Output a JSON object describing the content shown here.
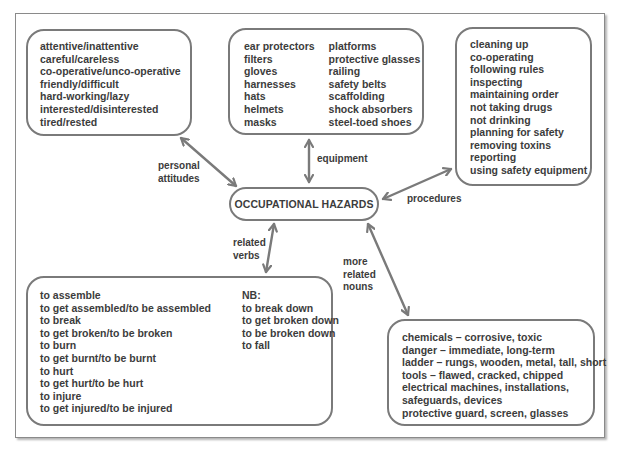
{
  "diagram": {
    "center": {
      "title": "OCCUPATIONAL HAZARDS"
    },
    "links": {
      "personal_attitudes": "personal\nattitudes",
      "personal_attitudes_l1": "personal",
      "personal_attitudes_l2": "attitudes",
      "equipment": "equipment",
      "procedures": "procedures",
      "related_verbs_l1": "related",
      "related_verbs_l2": "verbs",
      "more_related_nouns_l1": "more",
      "more_related_nouns_l2": "related",
      "more_related_nouns_l3": "nouns"
    },
    "personal_attitudes": {
      "items": [
        "attentive/inattentive",
        "careful/careless",
        "co-operative/unco-operative",
        "friendly/difficult",
        "hard-working/lazy",
        "interested/disinterested",
        "tired/rested"
      ]
    },
    "equipment": {
      "col1": [
        "ear protectors",
        "filters",
        "gloves",
        "harnesses",
        "hats",
        "helmets",
        "masks"
      ],
      "col2": [
        "platforms",
        "protective glasses",
        "railing",
        "safety belts",
        "scaffolding",
        "shock absorbers",
        "steel-toed shoes"
      ]
    },
    "procedures": {
      "items": [
        "cleaning up",
        "co-operating",
        "following rules",
        "inspecting",
        "maintaining order",
        "not taking drugs",
        "not drinking",
        "planning for safety",
        "removing toxins",
        "reporting",
        "using safety equipment"
      ]
    },
    "related_verbs": {
      "col1": [
        "to assemble",
        "to get assembled/to be assembled",
        "to break",
        "to get broken/to be broken",
        "to burn",
        "to get burnt/to be burnt",
        "to hurt",
        "to get hurt/to be hurt",
        "to injure",
        "to get injured/to be injured"
      ],
      "col2": [
        "NB:",
        "to break down",
        "to get broken down",
        "to be broken down",
        "to fall"
      ]
    },
    "more_related_nouns": {
      "items": [
        "chemicals – corrosive, toxic",
        "danger – immediate, long-term",
        "ladder – rungs, wooden, metal, tall, short",
        "tools – flawed, cracked, chipped",
        "electrical machines, installations,",
        "safeguards, devices",
        "protective guard, screen, glasses"
      ]
    },
    "colors": {
      "stroke": "#7a7a7a",
      "text": "#3c3c3c",
      "frame": "#8a8a8a"
    }
  }
}
